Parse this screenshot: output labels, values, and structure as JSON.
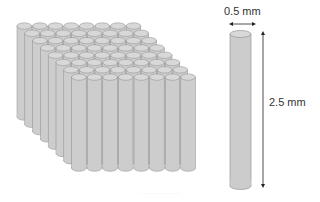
{
  "diagram": {
    "array": {
      "rows": 8,
      "columns": 8,
      "fill_color": "#cdcdcd",
      "top_color": "#d8d8d8",
      "stroke_color": "#8a8a8a"
    },
    "single_cylinder": {
      "diameter_label": "0.5 mm",
      "height_label": "2.5 mm",
      "fill_color": "#cccccc"
    },
    "caption": "·· ··· ··· ··· ·······"
  }
}
